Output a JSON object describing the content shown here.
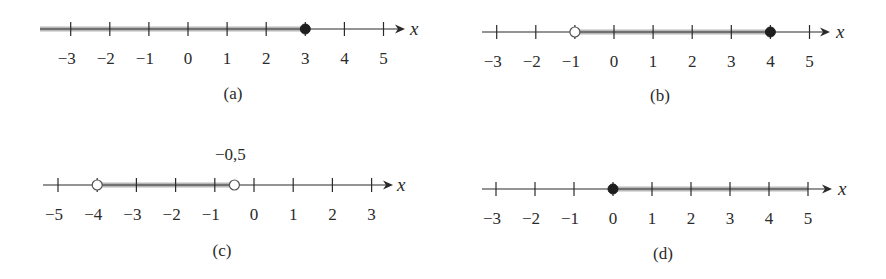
{
  "figure": {
    "width": 886,
    "height": 279,
    "colors": {
      "axis": "#2a2a2a",
      "shade": "#b8b8b8",
      "closed_dot": "#1e1e1e",
      "open_dot_fill": "#ffffff",
      "open_dot_stroke": "#555555"
    }
  },
  "chart_data": [
    {
      "type": "number-line",
      "id": "a",
      "caption": "(a)",
      "variable": "x",
      "ticks": [
        -3,
        -2,
        -1,
        0,
        1,
        2,
        3,
        4,
        5
      ],
      "tick_labels": [
        "−3",
        "−2",
        "−1",
        "0",
        "1",
        "2",
        "3",
        "4",
        "5"
      ],
      "interval": {
        "from": "-infinity",
        "to": 3,
        "left_closed": false,
        "right_closed": true
      },
      "endpoints": [
        {
          "value": 3,
          "style": "closed"
        }
      ],
      "annotation": null,
      "layout": {
        "axis_y": 29,
        "x_start": 40,
        "x_end": 405,
        "unit_px": 39.1,
        "zero_px": 188,
        "shade_from_px": 40,
        "label_y": 58,
        "caption_x": 233,
        "caption_y": 99,
        "var_x": 410
      }
    },
    {
      "type": "number-line",
      "id": "b",
      "caption": "(b)",
      "variable": "x",
      "ticks": [
        -3,
        -2,
        -1,
        0,
        1,
        2,
        3,
        4,
        5
      ],
      "tick_labels": [
        "−3",
        "−2",
        "−1",
        "0",
        "1",
        "2",
        "3",
        "4",
        "5"
      ],
      "interval": {
        "from": -1,
        "to": 4,
        "left_closed": false,
        "right_closed": true
      },
      "endpoints": [
        {
          "value": -1,
          "style": "open"
        },
        {
          "value": 4,
          "style": "closed"
        }
      ],
      "annotation": null,
      "layout": {
        "axis_y": 32,
        "x_start": 482,
        "x_end": 830,
        "unit_px": 39.1,
        "zero_px": 614,
        "label_y": 61,
        "caption_x": 660,
        "caption_y": 101,
        "var_x": 836
      }
    },
    {
      "type": "number-line",
      "id": "c",
      "caption": "(c)",
      "variable": "x",
      "ticks": [
        -5,
        -4,
        -3,
        -2,
        -1,
        0,
        1,
        2,
        3
      ],
      "tick_labels": [
        "−5",
        "−4",
        "−3",
        "−2",
        "−1",
        "0",
        "1",
        "2",
        "3"
      ],
      "interval": {
        "from": -4,
        "to": -0.5,
        "left_closed": false,
        "right_closed": false
      },
      "endpoints": [
        {
          "value": -4,
          "style": "open"
        },
        {
          "value": -0.5,
          "style": "open"
        }
      ],
      "annotation": {
        "text": "−0,5",
        "value": -0.5
      },
      "layout": {
        "axis_y": 185,
        "x_start": 43,
        "x_end": 393,
        "unit_px": 39.2,
        "zero_px": 254,
        "label_y": 214,
        "caption_x": 222,
        "caption_y": 256,
        "var_x": 397,
        "annotation_y": 160
      }
    },
    {
      "type": "number-line",
      "id": "d",
      "caption": "(d)",
      "variable": "x",
      "ticks": [
        -3,
        -2,
        -1,
        0,
        1,
        2,
        3,
        4,
        5
      ],
      "tick_labels": [
        "−3",
        "−2",
        "−1",
        "0",
        "1",
        "2",
        "3",
        "4",
        "5"
      ],
      "interval": {
        "from": 0,
        "to": 5,
        "left_closed": true,
        "right_closed": true
      },
      "endpoints": [
        {
          "value": 0,
          "style": "closed"
        }
      ],
      "annotation": null,
      "layout": {
        "axis_y": 189,
        "x_start": 482,
        "x_end": 832,
        "unit_px": 39.0,
        "zero_px": 613,
        "label_y": 218,
        "caption_x": 663,
        "caption_y": 259,
        "var_x": 838
      }
    }
  ]
}
